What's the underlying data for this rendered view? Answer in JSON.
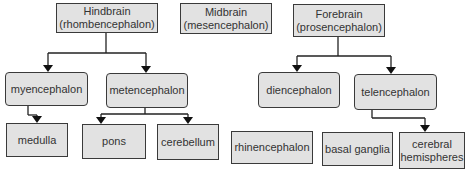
{
  "diagram": {
    "type": "hierarchy",
    "top_level": [
      {
        "id": "hindbrain",
        "line1": "Hindbrain",
        "line2": "(rhombencephalon)"
      },
      {
        "id": "midbrain",
        "line1": "Midbrain",
        "line2": "(mesencephalon)"
      },
      {
        "id": "forebrain",
        "line1": "Forebrain",
        "line2": "(prosencephalon)"
      }
    ],
    "second_level": [
      {
        "id": "myencephalon",
        "label": "myencephalon",
        "parent": "hindbrain"
      },
      {
        "id": "metencephalon",
        "label": "metencephalon",
        "parent": "hindbrain"
      },
      {
        "id": "diencephalon",
        "label": "diencephalon",
        "parent": "forebrain"
      },
      {
        "id": "telencephalon",
        "label": "telencephalon",
        "parent": "forebrain"
      }
    ],
    "third_level": [
      {
        "id": "medulla",
        "label": "medulla",
        "parent": "myencephalon"
      },
      {
        "id": "pons",
        "label": "pons",
        "parent": "metencephalon"
      },
      {
        "id": "cerebellum",
        "label": "cerebellum",
        "parent": "metencephalon"
      },
      {
        "id": "rhinencephalon",
        "label": "rhinencephalon",
        "parent": null
      },
      {
        "id": "basal-ganglia",
        "label": "basal ganglia",
        "parent": null
      },
      {
        "id": "cerebral-hemispheres",
        "line1": "cerebral",
        "line2": "hemispheres",
        "parent": "telencephalon"
      }
    ],
    "colors": {
      "box_fill": "#e2e2e2",
      "box_border": "#3a3a3a",
      "text": "#333333",
      "line": "#222222"
    }
  }
}
